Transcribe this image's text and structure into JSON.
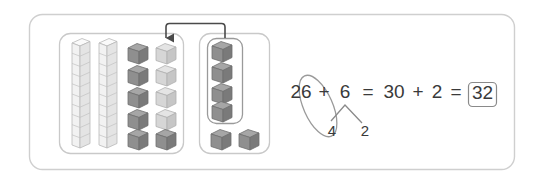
{
  "frame": {
    "border_color": "#cfcfcf",
    "background": "#ffffff"
  },
  "colors": {
    "rod_face": "#f2f2f2",
    "rod_side": "#e2e2e2",
    "rod_top": "#fafafa",
    "rod_outline": "#b9b9b9",
    "cube_dark_face": "#8f8f8f",
    "cube_dark_side": "#7a7a7a",
    "cube_dark_top": "#a6a6a6",
    "cube_light_face": "#d6d6d6",
    "cube_light_side": "#c6c6c6",
    "cube_light_top": "#e4e4e4",
    "cube_outline": "#6f6f6f",
    "group_box_border": "#c9c9c9",
    "inner_box_border": "#9a9a9a",
    "arrow_color": "#4a4a4a",
    "text_color": "#3a3a3a",
    "ellipse_color": "#9a9a9a",
    "branch_color": "#8a8a8a",
    "answer_box_border": "#8a8a8a"
  },
  "left_group": {
    "label": "tens-and-ones-group",
    "tens_rods": 2,
    "rod_segments": 10,
    "tens_value": 20,
    "ones_columns": 2,
    "ones_rows": 5,
    "ones_total": 10,
    "ones_dark_count": 6,
    "ones_light_count": 4,
    "light_meaning": "received-ones",
    "dark_cubes": [
      {
        "col": 0,
        "row": 0
      },
      {
        "col": 0,
        "row": 1
      },
      {
        "col": 0,
        "row": 2
      },
      {
        "col": 0,
        "row": 3
      },
      {
        "col": 0,
        "row": 4
      },
      {
        "col": 1,
        "row": 4
      }
    ],
    "light_cubes": [
      {
        "col": 1,
        "row": 0
      },
      {
        "col": 1,
        "row": 1
      },
      {
        "col": 1,
        "row": 2
      },
      {
        "col": 1,
        "row": 3
      }
    ]
  },
  "right_group": {
    "label": "addend-ones-group",
    "total_cubes": 6,
    "inner_box_cubes": 4,
    "outside_cubes": 2,
    "inner_box_label": "moved-four-ones"
  },
  "arrow": {
    "label": "move-four-ones-arrow",
    "from": "right-group-inner-box",
    "to": "left-group-top-right-cube",
    "direction": "right-to-left"
  },
  "equation": {
    "tokens": [
      {
        "id": "addend1",
        "text": "26",
        "circled": true
      },
      {
        "id": "plus1",
        "text": "+"
      },
      {
        "id": "addend2",
        "text": "6"
      },
      {
        "id": "equals1",
        "text": "="
      },
      {
        "id": "sum_tens",
        "text": "30"
      },
      {
        "id": "plus2",
        "text": "+"
      },
      {
        "id": "remainder",
        "text": "2"
      },
      {
        "id": "equals2",
        "text": "="
      },
      {
        "id": "answer",
        "text": "32",
        "boxed": true
      }
    ],
    "full_text": "26 + 6 = 30 + 2 = 32",
    "decomposition": {
      "of": "6",
      "left_part": "4",
      "right_part": "2"
    },
    "ellipse_groups": [
      "26",
      "4"
    ],
    "answer": "32"
  }
}
